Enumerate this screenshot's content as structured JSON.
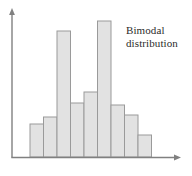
{
  "figure": {
    "width": 192,
    "height": 176,
    "background": "#ffffff"
  },
  "annotation": {
    "name": "bimodal-distribution-label",
    "line1": "Bimodal",
    "line2": "distribution",
    "full_text": "Bimodal distribution",
    "color": "#2b2b2b"
  },
  "axes": {
    "y_axis_label": "",
    "x_axis_label": "",
    "color": "#808080",
    "origin_x": 12,
    "baseline_y": 157,
    "y_axis_top": 10,
    "x_axis_right": 180,
    "has_arrowheads": true,
    "grid": false,
    "tick_labels_x": [],
    "tick_labels_y": []
  },
  "style": {
    "bar_fill": "#e2e2e2",
    "bar_stroke": "#9a9a9a",
    "bar_stroke_width": 1,
    "axis_stroke_width": 1.4
  },
  "chart_data": {
    "type": "bar",
    "title": "Bimodal distribution",
    "xlabel": "",
    "ylabel": "",
    "grid": false,
    "legend": false,
    "legend_position": "none",
    "categories": [
      "1",
      "2",
      "3",
      "4",
      "5",
      "6",
      "7",
      "8",
      "9"
    ],
    "values": [
      23,
      27,
      86,
      37,
      44,
      93,
      35,
      29,
      15
    ],
    "ylim": [
      0,
      100
    ],
    "xlim": [
      0,
      9
    ],
    "annotations": [
      "Bimodal distribution"
    ],
    "bar_pixel_geometry": {
      "baseline_y": 157,
      "bar_width": 13.5,
      "left_edges": [
        30.0,
        43.5,
        57.0,
        70.5,
        84.0,
        97.5,
        111.0,
        124.5,
        138.0
      ],
      "tops": [
        124,
        117,
        31,
        103,
        92,
        21,
        105,
        115,
        135
      ]
    }
  }
}
